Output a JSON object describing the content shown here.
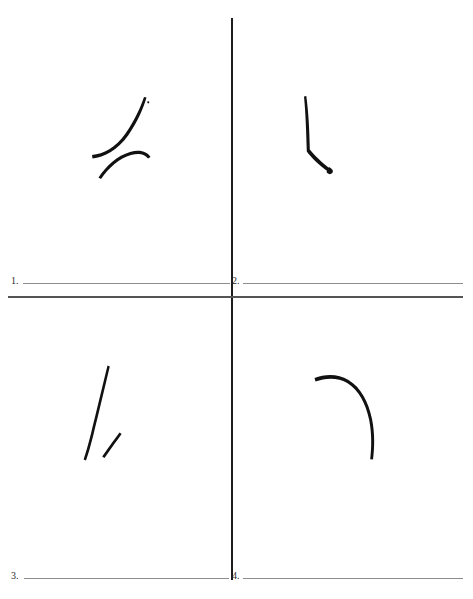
{
  "page": {
    "background_color": "#ffffff",
    "ink_color": "#111111",
    "rule_color": "#7d7d7d",
    "axis_color": "#1c1c1c",
    "width": 473,
    "height": 599
  },
  "axis": {
    "vertical_label": "vertical-divider",
    "horizontal_label": "horizontal-divider"
  },
  "items": [
    {
      "number": "1.",
      "quadrant": "top-left",
      "answer_value": "",
      "answer_placeholder": ""
    },
    {
      "number": "2.",
      "quadrant": "top-right",
      "answer_value": "",
      "answer_placeholder": ""
    },
    {
      "number": "3.",
      "quadrant": "bottom-left",
      "answer_value": "",
      "answer_placeholder": ""
    },
    {
      "number": "4.",
      "quadrant": "bottom-right",
      "answer_value": "",
      "answer_placeholder": ""
    }
  ],
  "artwork": {
    "quadrant_1": {
      "name": "top-left-strokes",
      "description": "two curved brush strokes",
      "stroke_count": 2
    },
    "quadrant_2": {
      "name": "top-right-strokes",
      "description": "vertical stroke with angled hook at base",
      "stroke_count": 1
    },
    "quadrant_3": {
      "name": "bottom-left-strokes",
      "description": "long diagonal stroke and short diagonal stroke",
      "stroke_count": 2
    },
    "quadrant_4": {
      "name": "bottom-right-strokes",
      "description": "single long arc curving down to the right",
      "stroke_count": 1
    }
  }
}
